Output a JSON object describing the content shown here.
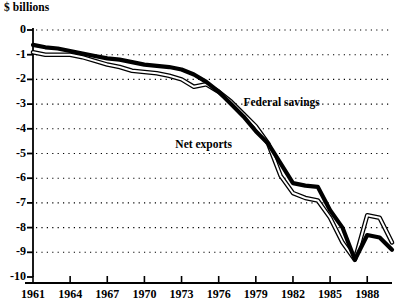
{
  "chart_data": {
    "type": "line",
    "title": "",
    "ylabel": "$ billions",
    "xlabel": "",
    "ylim": [
      -10,
      0
    ],
    "xlim": [
      1961,
      1990
    ],
    "grid": true,
    "legend_position": "inline-annotations",
    "y_ticks": [
      "0",
      "-1",
      "-2",
      "-3",
      "-4",
      "-5",
      "-6",
      "-7",
      "-8",
      "-9",
      "-10"
    ],
    "y_tick_values": [
      0,
      -1,
      -2,
      -3,
      -4,
      -5,
      -6,
      -7,
      -8,
      -9,
      -10
    ],
    "x_ticks": [
      "1961",
      "1964",
      "1967",
      "1970",
      "1973",
      "1976",
      "1979",
      "1982",
      "1985",
      "1988"
    ],
    "x_tick_values": [
      1961,
      1964,
      1967,
      1970,
      1973,
      1976,
      1979,
      1982,
      1985,
      1988
    ],
    "x": [
      1961,
      1962,
      1963,
      1964,
      1965,
      1966,
      1967,
      1968,
      1969,
      1970,
      1971,
      1972,
      1973,
      1974,
      1975,
      1976,
      1977,
      1978,
      1979,
      1980,
      1981,
      1982,
      1983,
      1984,
      1985,
      1986,
      1987,
      1988,
      1989,
      1990
    ],
    "series": [
      {
        "name": "Federal savings",
        "style": "thick-solid",
        "color": "#000000",
        "values": [
          -0.6,
          -0.7,
          -0.75,
          -0.85,
          -0.95,
          -1.05,
          -1.15,
          -1.2,
          -1.3,
          -1.4,
          -1.45,
          -1.5,
          -1.6,
          -1.8,
          -2.1,
          -2.5,
          -3.0,
          -3.5,
          -4.1,
          -4.6,
          -5.4,
          -6.2,
          -6.3,
          -6.35,
          -7.3,
          -8.0,
          -9.3,
          -8.3,
          -8.4,
          -8.9
        ]
      },
      {
        "name": "Net exports",
        "style": "double-outline",
        "color": "#000000",
        "values": [
          -0.9,
          -1.0,
          -1.0,
          -1.0,
          -1.1,
          -1.25,
          -1.4,
          -1.5,
          -1.65,
          -1.7,
          -1.75,
          -1.85,
          -2.0,
          -2.3,
          -2.2,
          -2.5,
          -2.9,
          -3.4,
          -3.9,
          -4.6,
          -5.9,
          -6.6,
          -6.8,
          -6.9,
          -7.6,
          -8.6,
          -9.3,
          -7.5,
          -7.6,
          -8.6
        ]
      }
    ],
    "annotations": [
      {
        "text": "Federal savings",
        "x": 1978,
        "y": -3.0
      },
      {
        "text": "Net exports",
        "x": 1972.5,
        "y": -4.7
      }
    ]
  }
}
